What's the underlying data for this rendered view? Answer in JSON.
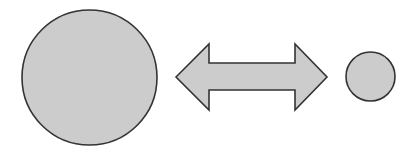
{
  "diagram": {
    "colors": {
      "fill": "#cccccc",
      "stroke": "#333333",
      "background": "#ffffff"
    },
    "shapes": [
      {
        "id": "large-circle",
        "type": "circle",
        "cx": 89.5,
        "cy": 77.5,
        "r": 67.5
      },
      {
        "id": "double-arrow",
        "type": "double-headed-arrow",
        "direction": "horizontal"
      },
      {
        "id": "small-circle",
        "type": "circle",
        "cx": 370.5,
        "cy": 76.5,
        "r": 24.5
      }
    ]
  }
}
